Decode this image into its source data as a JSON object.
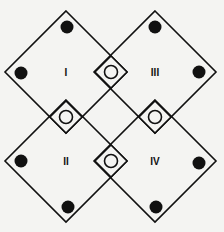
{
  "diagram": {
    "type": "overlapping-diamonds",
    "colors": {
      "background": "#f4f4f2",
      "stroke": "#111111",
      "filled_dot": "#111111",
      "open_dot": "#f4f4f2"
    },
    "large_diamonds": [
      {
        "id": "I",
        "label": "I",
        "cx": 66,
        "cy": 72,
        "r": 61
      },
      {
        "id": "III",
        "label": "III",
        "cx": 155,
        "cy": 72,
        "r": 61
      },
      {
        "id": "II",
        "label": "II",
        "cx": 66,
        "cy": 161,
        "r": 61
      },
      {
        "id": "IV",
        "label": "IV",
        "cx": 155,
        "cy": 161,
        "r": 61
      }
    ],
    "small_diamonds": [
      {
        "cx": 111,
        "cy": 72,
        "r": 16
      },
      {
        "cx": 66,
        "cy": 117,
        "r": 16
      },
      {
        "cx": 155,
        "cy": 117,
        "r": 16
      },
      {
        "cx": 111,
        "cy": 161,
        "r": 16
      }
    ],
    "filled_dots": [
      {
        "cx": 67,
        "cy": 27
      },
      {
        "cx": 21,
        "cy": 73
      },
      {
        "cx": 155,
        "cy": 27
      },
      {
        "cx": 199,
        "cy": 72
      },
      {
        "cx": 21,
        "cy": 161
      },
      {
        "cx": 68,
        "cy": 207
      },
      {
        "cx": 199,
        "cy": 163
      },
      {
        "cx": 156,
        "cy": 207
      }
    ],
    "open_dots": [
      {
        "cx": 111,
        "cy": 72
      },
      {
        "cx": 66,
        "cy": 117
      },
      {
        "cx": 155,
        "cy": 117
      },
      {
        "cx": 111,
        "cy": 161
      }
    ]
  }
}
